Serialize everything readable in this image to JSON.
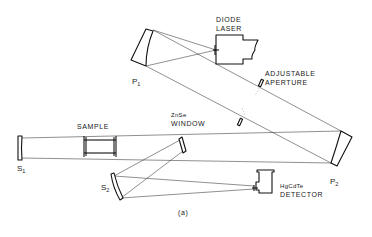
{
  "figure": {
    "caption": "(a)",
    "components": {
      "p1": {
        "symbol": "P",
        "subscript": "1"
      },
      "p2": {
        "symbol": "P",
        "subscript": "2"
      },
      "s1": {
        "symbol": "S",
        "subscript": "1"
      },
      "s2": {
        "symbol": "S",
        "subscript": "2"
      },
      "diode_laser": {
        "line1": "DIODE",
        "line2": "LASER"
      },
      "aperture": {
        "line1": "ADJUSTABLE",
        "line2": "APERTURE"
      },
      "sample": {
        "label": "SAMPLE"
      },
      "window": {
        "line1": "ZnSe",
        "line2": "WINDOW"
      },
      "detector": {
        "line1": "HgCdTe",
        "line2": "DETECTOR"
      }
    },
    "colors": {
      "ink": "#111111",
      "background": "#ffffff"
    }
  }
}
